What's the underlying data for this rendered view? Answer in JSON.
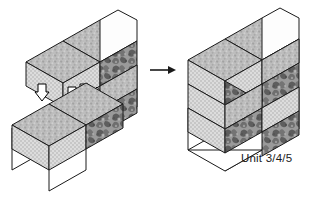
{
  "figure": {
    "caption_label": "Unit 3/4/5",
    "transition_arrow": "right-arrow",
    "background_color": "#ffffff"
  },
  "palette": {
    "outline": "#1a1a1a",
    "ground_plane": "#ffffff",
    "top_face": "#b9b9b9",
    "left_face": "#d8d8d8",
    "right_face": "#8e8e8e",
    "blank_face": "#fdfdfd",
    "arrow_fill": "#ffffff",
    "arrow_stroke": "#000000",
    "text": "#1a1a1a"
  },
  "textures": {
    "top": "speckled-mid-gray",
    "left": "fine-dot-grid",
    "right": "mottled-organic-dark",
    "blank": "plain-white"
  },
  "left_group": {
    "name": "exploded-view",
    "description": "Two separated sub-assemblies before joining",
    "parts": [
      {
        "id": "upper-assembly",
        "label": "",
        "faces": [
          "top",
          "left",
          "right",
          "blank"
        ]
      },
      {
        "id": "lower-assembly",
        "label": "",
        "faces": [
          "top",
          "left",
          "right"
        ]
      }
    ],
    "motion_arrows": [
      {
        "id": "arrow-up-left",
        "direction": "up"
      },
      {
        "id": "arrow-up-mid-a",
        "direction": "up"
      },
      {
        "id": "arrow-up-mid-b",
        "direction": "up"
      },
      {
        "id": "arrow-down-right",
        "direction": "down"
      }
    ]
  },
  "right_group": {
    "name": "assembled-view",
    "description": "Completed joined unit",
    "parts": [
      {
        "id": "assembled-unit",
        "label": "Unit 3/4/5",
        "faces": [
          "top",
          "left",
          "right",
          "blank"
        ]
      }
    ]
  }
}
